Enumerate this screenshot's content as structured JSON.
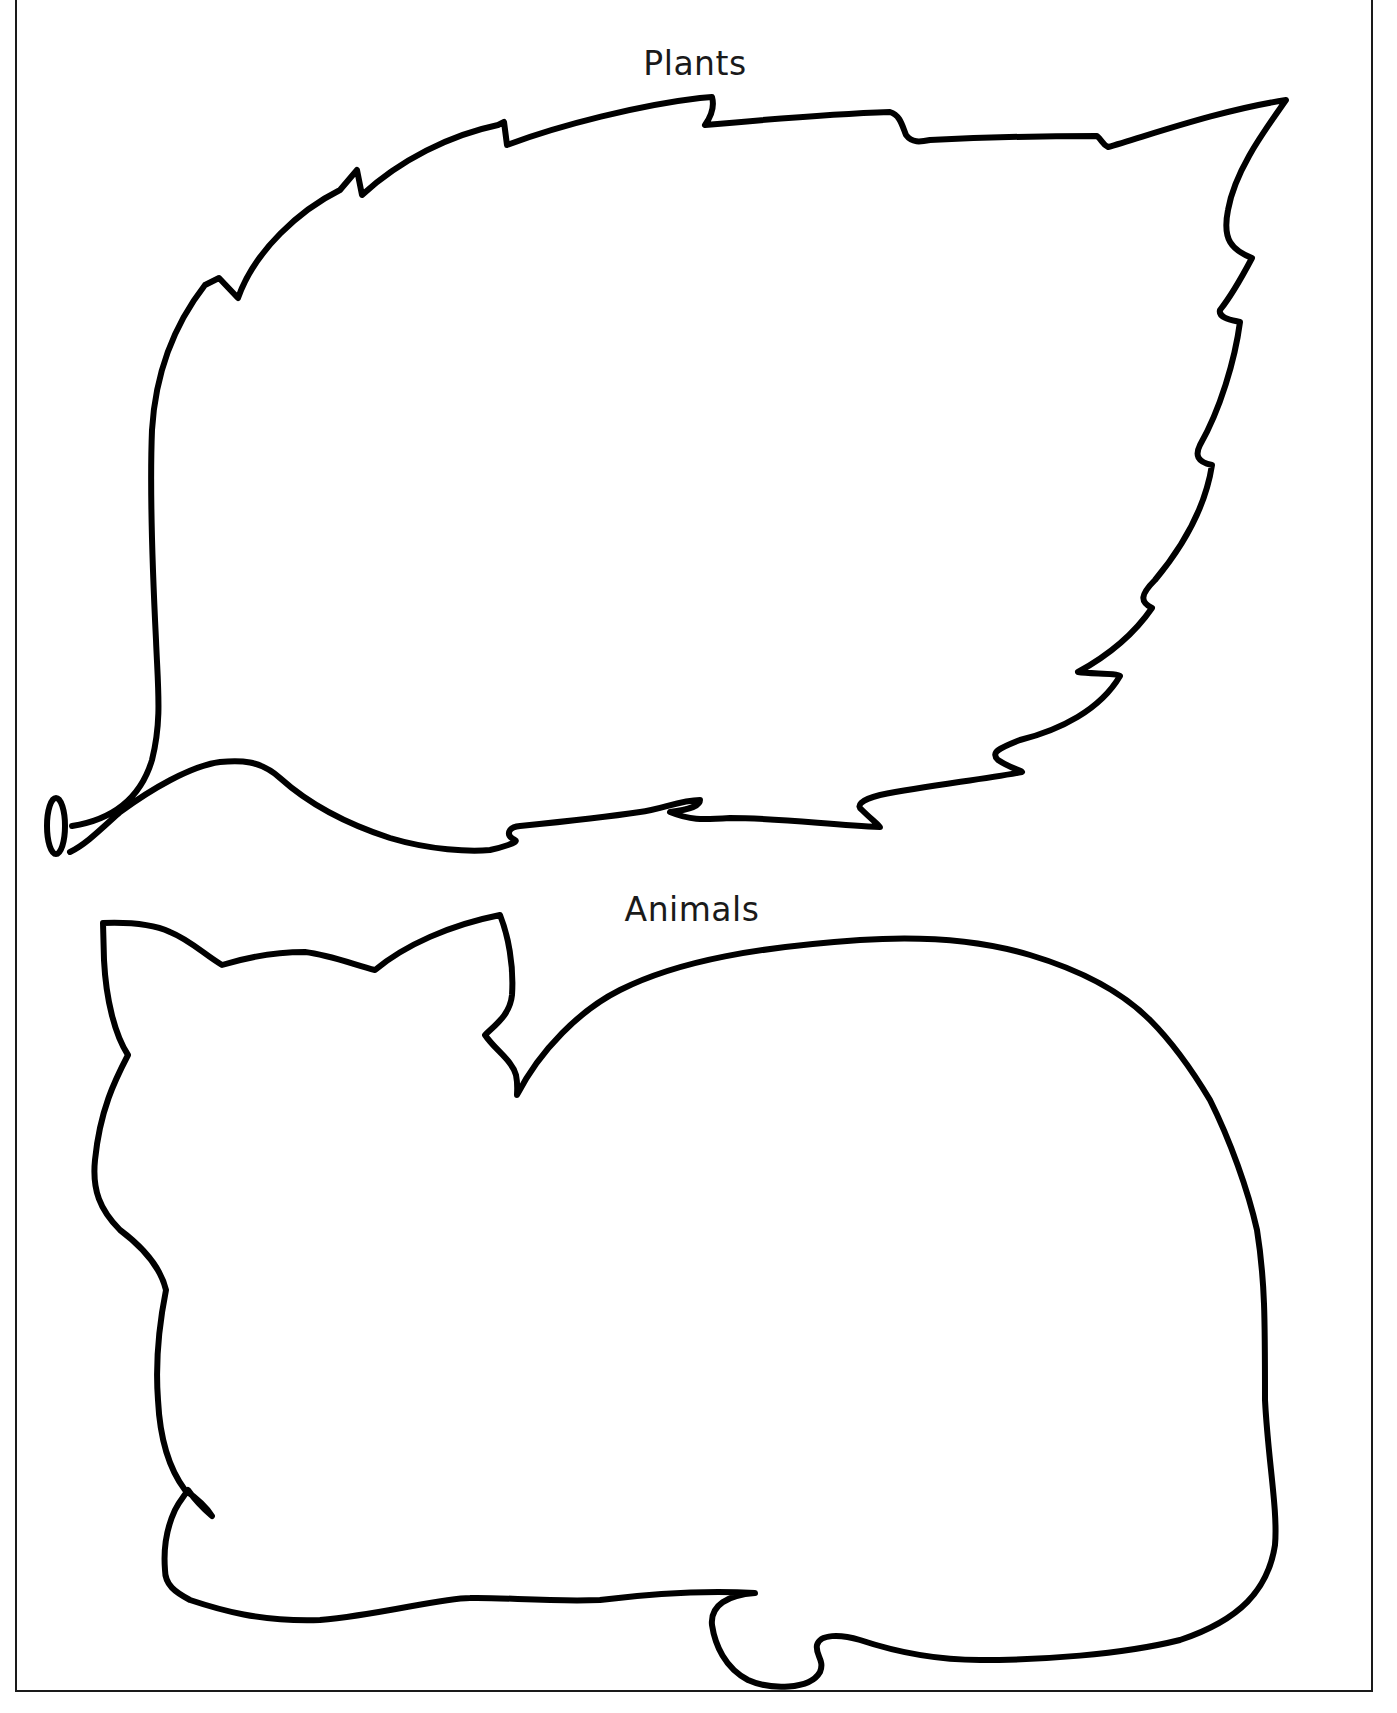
{
  "worksheet": {
    "sections": [
      {
        "id": "plants",
        "label": "Plants",
        "shape": "leaf-outline"
      },
      {
        "id": "animals",
        "label": "Animals",
        "shape": "cat-outline"
      }
    ]
  },
  "colors": {
    "outline": "#000000",
    "text": "#1a1a1a",
    "background": "#ffffff"
  }
}
